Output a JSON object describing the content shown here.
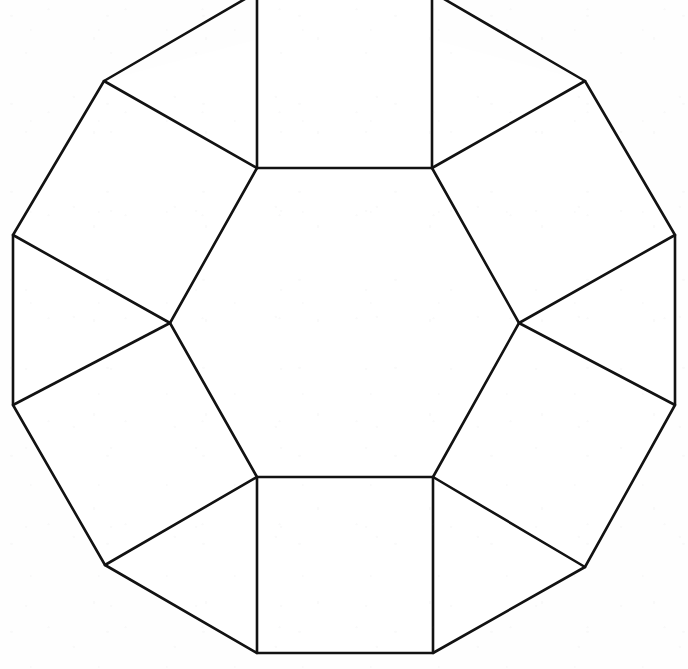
{
  "figure": {
    "background_color": "#fefefe",
    "stroke_color": "#121212",
    "fill_color": "#ffffff",
    "stroke_width": 2.6,
    "canvas": {
      "width": 688,
      "height": 669
    },
    "crop_note": "top edge of figure extends beyond frame",
    "counts": {
      "hexagons": 1,
      "squares": 6,
      "triangles": 6
    },
    "vertices": {
      "hexagon": [
        {
          "name": "hex-top-left",
          "x": 257,
          "y": 168
        },
        {
          "name": "hex-top-right",
          "x": 432,
          "y": 168
        },
        {
          "name": "hex-right",
          "x": 519,
          "y": 323
        },
        {
          "name": "hex-bottom-right",
          "x": 433,
          "y": 477
        },
        {
          "name": "hex-bottom-left",
          "x": 257,
          "y": 477
        },
        {
          "name": "hex-left",
          "x": 170,
          "y": 323
        }
      ],
      "outer": [
        {
          "name": "outer-top-left-up",
          "x": 257,
          "y": -8
        },
        {
          "name": "outer-top-right-up",
          "x": 432,
          "y": -8
        },
        {
          "name": "outer-upper-right",
          "x": 585,
          "y": 81
        },
        {
          "name": "outer-right-upper",
          "x": 675,
          "y": 235
        },
        {
          "name": "outer-right-lower",
          "x": 675,
          "y": 405
        },
        {
          "name": "outer-lower-right",
          "x": 585,
          "y": 567
        },
        {
          "name": "outer-bottom-right",
          "x": 433,
          "y": 653
        },
        {
          "name": "outer-bottom-left",
          "x": 257,
          "y": 653
        },
        {
          "name": "outer-lower-left",
          "x": 105,
          "y": 565
        },
        {
          "name": "outer-left-lower",
          "x": 13,
          "y": 405
        },
        {
          "name": "outer-left-upper",
          "x": 13,
          "y": 235
        },
        {
          "name": "outer-upper-left",
          "x": 104,
          "y": 81
        }
      ]
    },
    "faces": {
      "hexagon": [
        [
          257,
          168
        ],
        [
          432,
          168
        ],
        [
          519,
          323
        ],
        [
          433,
          477
        ],
        [
          257,
          477
        ],
        [
          170,
          323
        ]
      ],
      "squares": [
        {
          "name": "square-top",
          "points": [
            [
              257,
              168
            ],
            [
              432,
              168
            ],
            [
              432,
              -8
            ],
            [
              257,
              -8
            ]
          ]
        },
        {
          "name": "square-upper-right",
          "points": [
            [
              432,
              168
            ],
            [
              519,
              323
            ],
            [
              675,
              235
            ],
            [
              585,
              81
            ]
          ]
        },
        {
          "name": "square-lower-right",
          "points": [
            [
              519,
              323
            ],
            [
              433,
              477
            ],
            [
              585,
              567
            ],
            [
              675,
              405
            ]
          ]
        },
        {
          "name": "square-bottom",
          "points": [
            [
              433,
              477
            ],
            [
              257,
              477
            ],
            [
              257,
              653
            ],
            [
              433,
              653
            ]
          ]
        },
        {
          "name": "square-lower-left",
          "points": [
            [
              257,
              477
            ],
            [
              170,
              323
            ],
            [
              13,
              405
            ],
            [
              105,
              565
            ]
          ]
        },
        {
          "name": "square-upper-left",
          "points": [
            [
              170,
              323
            ],
            [
              257,
              168
            ],
            [
              104,
              81
            ],
            [
              13,
              235
            ]
          ]
        }
      ],
      "triangles": [
        {
          "name": "triangle-upper-right",
          "points": [
            [
              432,
              168
            ],
            [
              585,
              81
            ],
            [
              257,
              -8
            ]
          ]
        },
        {
          "name": "triangle-right-upper",
          "points": [
            [
              519,
              323
            ],
            [
              675,
              235
            ],
            [
              675,
              405
            ]
          ]
        },
        {
          "name": "triangle-right-lower",
          "points": [
            [
              433,
              477
            ],
            [
              585,
              567
            ],
            [
              433,
              653
            ]
          ]
        },
        {
          "name": "triangle-lower-left",
          "points": [
            [
              257,
              477
            ],
            [
              105,
              565
            ],
            [
              257,
              653
            ]
          ]
        },
        {
          "name": "triangle-left-lower",
          "points": [
            [
              170,
              323
            ],
            [
              13,
              405
            ],
            [
              13,
              235
            ]
          ]
        },
        {
          "name": "triangle-left-upper",
          "points": [
            [
              257,
              168
            ],
            [
              104,
              81
            ],
            [
              432,
              -8
            ]
          ]
        }
      ]
    },
    "edges": {
      "hexagon_sides": [
        {
          "name": "hex-edge-top",
          "from": [
            257,
            168
          ],
          "to": [
            432,
            168
          ]
        },
        {
          "name": "hex-edge-upper-right",
          "from": [
            432,
            168
          ],
          "to": [
            519,
            323
          ]
        },
        {
          "name": "hex-edge-lower-right",
          "from": [
            519,
            323
          ],
          "to": [
            433,
            477
          ]
        },
        {
          "name": "hex-edge-bottom",
          "from": [
            433,
            477
          ],
          "to": [
            257,
            477
          ]
        },
        {
          "name": "hex-edge-lower-left",
          "from": [
            257,
            477
          ],
          "to": [
            170,
            323
          ]
        },
        {
          "name": "hex-edge-upper-left",
          "from": [
            170,
            323
          ],
          "to": [
            257,
            168
          ]
        }
      ],
      "outer_outline": [
        {
          "name": "outline-top",
          "from": [
            257,
            -8
          ],
          "to": [
            432,
            -8
          ]
        },
        {
          "name": "outline-upper-right-a",
          "from": [
            432,
            -8
          ],
          "to": [
            585,
            81
          ]
        },
        {
          "name": "outline-upper-right-b",
          "from": [
            585,
            81
          ],
          "to": [
            675,
            235
          ]
        },
        {
          "name": "outline-right",
          "from": [
            675,
            235
          ],
          "to": [
            675,
            405
          ]
        },
        {
          "name": "outline-lower-right-a",
          "from": [
            675,
            405
          ],
          "to": [
            585,
            567
          ]
        },
        {
          "name": "outline-lower-right-b",
          "from": [
            585,
            567
          ],
          "to": [
            433,
            653
          ]
        },
        {
          "name": "outline-bottom",
          "from": [
            433,
            653
          ],
          "to": [
            257,
            653
          ]
        },
        {
          "name": "outline-lower-left-b",
          "from": [
            257,
            653
          ],
          "to": [
            105,
            565
          ]
        },
        {
          "name": "outline-lower-left-a",
          "from": [
            105,
            565
          ],
          "to": [
            13,
            405
          ]
        },
        {
          "name": "outline-left",
          "from": [
            13,
            405
          ],
          "to": [
            13,
            235
          ]
        },
        {
          "name": "outline-upper-left-a",
          "from": [
            13,
            235
          ],
          "to": [
            104,
            81
          ]
        },
        {
          "name": "outline-upper-left-b",
          "from": [
            104,
            81
          ],
          "to": [
            257,
            -8
          ]
        }
      ],
      "spokes": [
        {
          "name": "spoke-top-left",
          "from": [
            257,
            168
          ],
          "to": [
            257,
            -8
          ]
        },
        {
          "name": "spoke-top-right",
          "from": [
            432,
            168
          ],
          "to": [
            432,
            -8
          ]
        },
        {
          "name": "spoke-upper-right-out",
          "from": [
            432,
            168
          ],
          "to": [
            585,
            81
          ]
        },
        {
          "name": "spoke-right-upper-out",
          "from": [
            519,
            323
          ],
          "to": [
            675,
            235
          ]
        },
        {
          "name": "spoke-right-lower-out",
          "from": [
            519,
            323
          ],
          "to": [
            675,
            405
          ]
        },
        {
          "name": "spoke-lower-right-out",
          "from": [
            433,
            477
          ],
          "to": [
            585,
            567
          ]
        },
        {
          "name": "spoke-bottom-right",
          "from": [
            433,
            477
          ],
          "to": [
            433,
            653
          ]
        },
        {
          "name": "spoke-bottom-left",
          "from": [
            257,
            477
          ],
          "to": [
            257,
            653
          ]
        },
        {
          "name": "spoke-lower-left-out",
          "from": [
            257,
            477
          ],
          "to": [
            105,
            565
          ]
        },
        {
          "name": "spoke-left-lower-out",
          "from": [
            170,
            323
          ],
          "to": [
            13,
            405
          ]
        },
        {
          "name": "spoke-left-upper-out",
          "from": [
            170,
            323
          ],
          "to": [
            13,
            235
          ]
        },
        {
          "name": "spoke-upper-left-out",
          "from": [
            257,
            168
          ],
          "to": [
            104,
            81
          ]
        }
      ]
    }
  }
}
